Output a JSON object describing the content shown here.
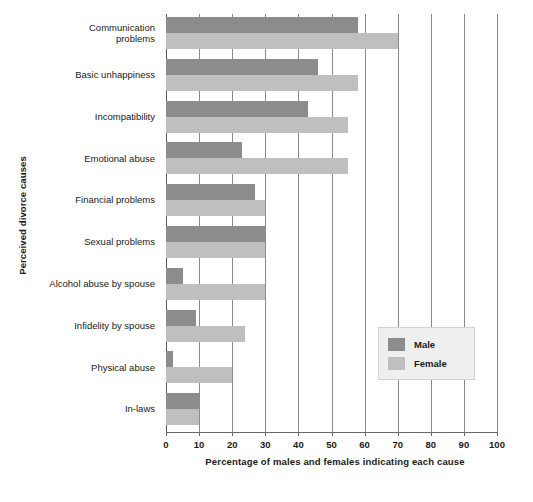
{
  "chart_data": {
    "type": "bar",
    "orientation": "horizontal",
    "title": "",
    "xlabel": "Percentage of males and females indicating each cause",
    "ylabel": "Perceived divorce causes",
    "xlim": [
      0,
      100
    ],
    "xticks": [
      "0",
      "10",
      "20",
      "30",
      "40",
      "50",
      "60",
      "70",
      "80",
      "90",
      "100"
    ],
    "grid": "vertical",
    "legend_position": "middle-right",
    "categories": [
      "Communication problems",
      "Basic unhappiness",
      "Incompatibility",
      "Emotional abuse",
      "Financial problems",
      "Sexual problems",
      "Alcohol abuse by spouse",
      "Infidelity by spouse",
      "Physical abuse",
      "In-laws"
    ],
    "series": [
      {
        "name": "Male",
        "color": "#8c8c8c",
        "values": [
          58,
          46,
          43,
          23,
          27,
          30,
          5,
          9,
          2,
          10
        ]
      },
      {
        "name": "Female",
        "color": "#bfbfbf",
        "values": [
          70,
          58,
          55,
          55,
          30,
          30,
          30,
          24,
          20,
          10
        ]
      }
    ]
  },
  "legend": {
    "items": [
      {
        "label": "Male",
        "swatch": "male"
      },
      {
        "label": "Female",
        "swatch": "female"
      }
    ]
  }
}
